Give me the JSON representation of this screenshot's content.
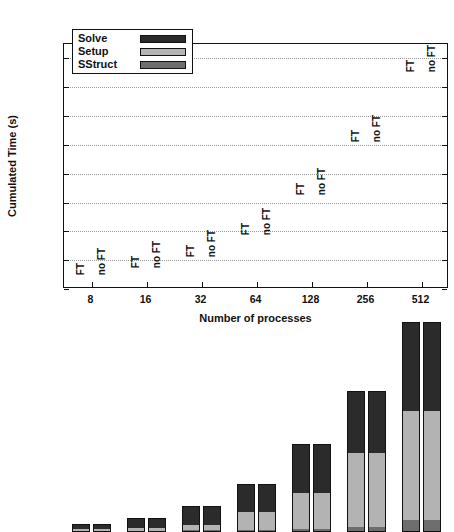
{
  "chart_data": {
    "type": "bar",
    "subtype": "stacked-grouped-bar",
    "title": "",
    "xlabel": "Number of processes",
    "ylabel": "Cumulated Time (s)",
    "categories": [
      "8",
      "16",
      "32",
      "64",
      "128",
      "256",
      "512"
    ],
    "group_labels": [
      "FT",
      "no FT"
    ],
    "ylim": [
      0,
      85
    ],
    "yticks": [
      0,
      10,
      20,
      30,
      40,
      50,
      60,
      70,
      80
    ],
    "ytick_labels": [
      "0",
      "10",
      "20",
      "30",
      "40",
      "50",
      "60",
      "70",
      "80"
    ],
    "grid": true,
    "legend_position": "upper-left",
    "legend": [
      "Solve",
      "Setup",
      "SStruct"
    ],
    "stack_order_bottom_to_top": [
      "SStruct",
      "Setup",
      "Solve"
    ],
    "colors": {
      "Solve": "#2b2b2b",
      "Setup": "#b3b3b3",
      "SStruct": "#6e6e6e",
      "axis": "#111111",
      "grid": "#9a9a9a",
      "background": "#ffffff"
    },
    "series": [
      {
        "name": "SStruct",
        "variant_FT": [
          0.4,
          0.5,
          0.6,
          0.8,
          1.2,
          1.8,
          4.0
        ],
        "variant_noFT": [
          0.4,
          0.5,
          0.6,
          0.8,
          1.2,
          1.8,
          4.0
        ]
      },
      {
        "name": "Setup",
        "variant_FT": [
          0.5,
          1.0,
          1.9,
          6.2,
          12.3,
          25.6,
          38.0
        ],
        "variant_noFT": [
          0.5,
          1.0,
          1.9,
          6.2,
          12.3,
          25.6,
          38.0
        ]
      },
      {
        "name": "Solve",
        "variant_FT": [
          1.9,
          3.5,
          6.5,
          9.5,
          17.0,
          21.6,
          31.0
        ],
        "variant_noFT": [
          1.9,
          3.5,
          6.5,
          9.5,
          17.0,
          21.6,
          31.0
        ]
      }
    ],
    "totals": {
      "FT": [
        2.8,
        5.0,
        9.0,
        16.5,
        30.5,
        49.0,
        73.0
      ],
      "noFT": [
        2.8,
        5.0,
        9.0,
        16.5,
        30.5,
        49.0,
        73.0
      ]
    }
  }
}
